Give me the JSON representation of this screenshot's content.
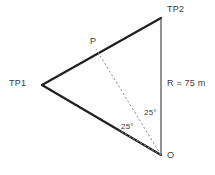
{
  "diagram": {
    "background_color": "#ffffff",
    "stroke_color": "#1f1f1f",
    "thin_stroke_color": "#3c3c3c",
    "dash_color": "#8c8c8c",
    "text_color": "#3a3a3a",
    "labels": {
      "tp1": "TP1",
      "tp2": "TP2",
      "p": "P",
      "o": "O",
      "radius": "R = 75 m",
      "angle_upper": "25°",
      "angle_lower": "25°"
    },
    "geometry": {
      "vertices": {
        "tp1": {
          "x": 42,
          "y": 85
        },
        "tp2": {
          "x": 161,
          "y": 18
        },
        "o": {
          "x": 161,
          "y": 155
        },
        "p": {
          "x": 96,
          "y": 49
        }
      },
      "edges": [
        {
          "name": "tp1-tp2",
          "from": "tp1",
          "to": "tp2",
          "style": "solid",
          "width": 2.2
        },
        {
          "name": "tp1-o",
          "from": "tp1",
          "to": "o",
          "style": "solid",
          "width": 2.2
        },
        {
          "name": "tp2-o",
          "from": "tp2",
          "to": "o",
          "style": "solid",
          "width": 1.1
        }
      ],
      "dashed_rays": [
        {
          "name": "o-to-p",
          "x1": 161,
          "y1": 155,
          "x2": 96,
          "y2": 49
        },
        {
          "name": "o-to-edge-a",
          "x1": 161,
          "y1": 155,
          "x2": 119,
          "y2": 130
        }
      ],
      "angles": [
        {
          "name": "angle-tp2-o-p",
          "value": 25,
          "unit": "deg"
        },
        {
          "name": "angle-p-o-tp1",
          "value": 25,
          "unit": "deg"
        }
      ]
    }
  }
}
